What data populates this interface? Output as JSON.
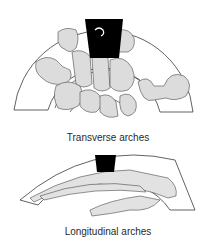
{
  "figure": {
    "top_panel": {
      "caption": "Transverse arches",
      "subject": "carpal bones viewed end-on with concentric arch bands"
    },
    "bottom_panel": {
      "caption": "Longitudinal arches",
      "subject": "hand skeleton viewed from the side with arch band"
    },
    "colors": {
      "bone_fill": "#dcdcdc",
      "outline": "#3a3a3a",
      "keystone": "#000000"
    }
  }
}
